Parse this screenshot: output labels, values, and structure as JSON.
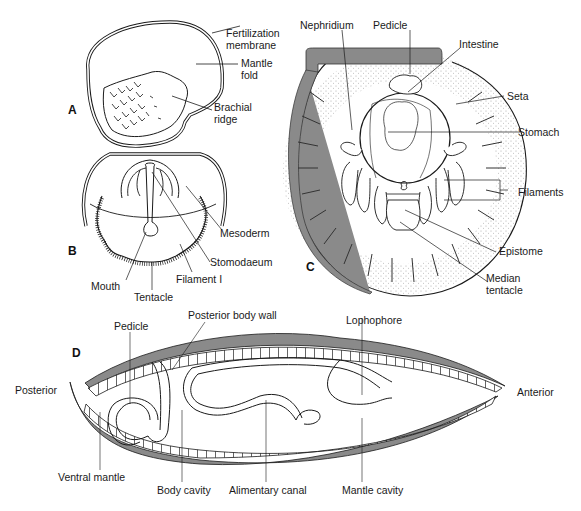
{
  "figure": {
    "panels": [
      {
        "id": "A",
        "letter": "A",
        "labels": {
          "fertilization_membrane": "Fertilization membrane",
          "mantle_fold": "Mantle fold",
          "brachial_ridge": "Brachial ridge"
        }
      },
      {
        "id": "B",
        "letter": "B",
        "labels": {
          "mesoderm": "Mesoderm",
          "stomodaeum": "Stomodaeum",
          "filament": "Filament I",
          "mouth": "Mouth",
          "tentacle": "Tentacle"
        }
      },
      {
        "id": "C",
        "letter": "C",
        "labels": {
          "nephridium": "Nephridium",
          "pedicle": "Pedicle",
          "intestine": "Intestine",
          "seta": "Seta",
          "stomach": "Stomach",
          "filaments": "Filaments",
          "epistome": "Epistome",
          "median_tentacle": "Median tentacle"
        }
      },
      {
        "id": "D",
        "letter": "D",
        "labels": {
          "pedicle": "Pedicle",
          "posterior_body_wall": "Posterior body wall",
          "lophophore": "Lophophore",
          "posterior": "Posterior",
          "anterior": "Anterior",
          "ventral_mantle": "Ventral mantle",
          "body_cavity": "Body cavity",
          "alimentary_canal": "Alimentary canal",
          "mantle_cavity": "Mantle cavity"
        }
      }
    ],
    "colors": {
      "line": "#1a1a1a",
      "shell_gray": "#8a8a8a",
      "stipple": "#b5b5b5",
      "background": "#ffffff"
    }
  },
  "A": {
    "letter": "A",
    "l1a": "Fertilization",
    "l1b": "membrane",
    "l2a": "Mantle",
    "l2b": "fold",
    "l3a": "Brachial",
    "l3b": "ridge"
  },
  "B": {
    "letter": "B",
    "mesoderm": "Mesoderm",
    "stomodaeum": "Stomodaeum",
    "filament": "Filament I",
    "mouth": "Mouth",
    "tentacle": "Tentacle"
  },
  "C": {
    "letter": "C",
    "nephridium": "Nephridium",
    "pedicle": "Pedicle",
    "intestine": "Intestine",
    "seta": "Seta",
    "stomach": "Stomach",
    "filaments": "Filaments",
    "epistome": "Epistome",
    "median_a": "Median",
    "median_b": "tentacle"
  },
  "D": {
    "letter": "D",
    "pedicle": "Pedicle",
    "pbw": "Posterior body wall",
    "lophophore": "Lophophore",
    "posterior": "Posterior",
    "anterior": "Anterior",
    "ventral": "Ventral mantle",
    "body_cavity": "Body cavity",
    "alimentary": "Alimentary canal",
    "mantle_cavity": "Mantle cavity"
  }
}
